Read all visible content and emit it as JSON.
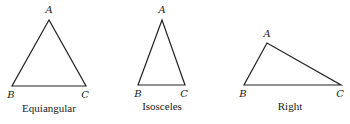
{
  "figure": {
    "triangles": [
      {
        "caption": "Equiangular",
        "vertices": {
          "A": {
            "label": "A",
            "x": 49,
            "y": 20
          },
          "B": {
            "label": "B",
            "x": 12,
            "y": 86
          },
          "C": {
            "label": "C",
            "x": 86,
            "y": 86
          }
        }
      },
      {
        "caption": "Isosceles",
        "vertices": {
          "A": {
            "label": "A",
            "x": 162,
            "y": 20
          },
          "B": {
            "label": "B",
            "x": 138,
            "y": 85
          },
          "C": {
            "label": "C",
            "x": 185,
            "y": 85
          }
        }
      },
      {
        "caption": "Right",
        "vertices": {
          "A": {
            "label": "A",
            "x": 267,
            "y": 43
          },
          "B": {
            "label": "B",
            "x": 244,
            "y": 85
          },
          "C": {
            "label": "C",
            "x": 341,
            "y": 85
          }
        }
      }
    ],
    "line_color": "#222222"
  }
}
